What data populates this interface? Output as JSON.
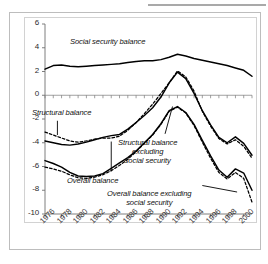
{
  "figure": {
    "background_color": "#ffffff",
    "frame_color": "#bdbdbd"
  },
  "chart_data": {
    "type": "line",
    "title": "",
    "subtitle": "",
    "xlabel": "",
    "ylabel": "",
    "xlim": [
      1976,
      2001
    ],
    "ylim": [
      -10,
      6
    ],
    "yticks": [
      6,
      4,
      2,
      0,
      -2,
      -4,
      -6,
      -8,
      -10
    ],
    "ytick_labels": [
      "6",
      "4",
      "2",
      "0",
      "-2",
      "-4",
      "-6",
      "-8",
      "-10"
    ],
    "xticks": [
      1976,
      1978,
      1980,
      1982,
      1984,
      1986,
      1988,
      1990,
      1992,
      1994,
      1996,
      1998,
      2000
    ],
    "xtick_labels": [
      "1976",
      "1978",
      "1980",
      "1982",
      "1984",
      "1986",
      "1988",
      "1990",
      "1992",
      "1994",
      "1996",
      "1998",
      "2000"
    ],
    "minor_xticks_annual": true,
    "grid": false,
    "zero_line": true,
    "legend": "inline-annotations",
    "x": [
      1976,
      1977,
      1978,
      1979,
      1980,
      1981,
      1982,
      1983,
      1984,
      1985,
      1986,
      1987,
      1988,
      1989,
      1990,
      1991,
      1992,
      1993,
      1994,
      1995,
      1996,
      1997,
      1998,
      1999,
      2000,
      2001
    ],
    "series": [
      {
        "name": "Social security balance",
        "style": "solid",
        "color": "#000000",
        "values": [
          2.2,
          2.5,
          2.55,
          2.45,
          2.4,
          2.45,
          2.5,
          2.55,
          2.6,
          2.65,
          2.75,
          2.85,
          2.9,
          2.9,
          3.0,
          3.2,
          3.45,
          3.3,
          3.1,
          2.95,
          2.8,
          2.65,
          2.5,
          2.3,
          2.1,
          1.6
        ]
      },
      {
        "name": "Structural balance excluding social security",
        "style": "solid",
        "color": "#000000",
        "values": [
          -3.85,
          -4.0,
          -4.15,
          -4.2,
          -4.1,
          -3.95,
          -3.75,
          -3.55,
          -3.4,
          -3.3,
          -2.85,
          -2.3,
          -1.7,
          -1.05,
          -0.15,
          1.05,
          1.95,
          1.4,
          0.15,
          -1.3,
          -2.5,
          -3.55,
          -4.0,
          -3.5,
          -4.05,
          -5.05
        ]
      },
      {
        "name": "Structural balance",
        "style": "solid",
        "color": "#000000",
        "values": [
          -3.85,
          -4.0,
          -4.15,
          -4.2,
          -4.1,
          -3.95,
          -3.75,
          -3.55,
          -3.4,
          -3.3,
          -2.85,
          -2.3,
          -1.7,
          -1.05,
          -0.15,
          1.05,
          1.95,
          1.4,
          0.15,
          -1.3,
          -2.5,
          -3.55,
          -4.0,
          -3.5,
          -4.05,
          -5.05
        ]
      },
      {
        "name": "Structural balance (dashed variant)",
        "style": "dashed",
        "color": "#000000",
        "values": [
          -3.1,
          -3.35,
          -3.6,
          -3.85,
          -3.95,
          -3.85,
          -3.7,
          -3.6,
          -3.6,
          -3.45,
          -2.95,
          -2.3,
          -1.55,
          -0.75,
          0.15,
          1.05,
          2.05,
          1.55,
          0.35,
          -1.35,
          -2.6,
          -3.65,
          -4.1,
          -3.75,
          -4.3,
          -5.3
        ]
      },
      {
        "name": "Overall balance",
        "style": "solid",
        "color": "#000000",
        "values": [
          -5.5,
          -5.75,
          -6.05,
          -6.5,
          -6.8,
          -6.85,
          -6.8,
          -6.6,
          -6.15,
          -5.7,
          -5.25,
          -4.7,
          -4.0,
          -3.3,
          -2.4,
          -1.3,
          -0.95,
          -1.45,
          -2.45,
          -3.8,
          -5.1,
          -6.3,
          -6.9,
          -6.2,
          -6.55,
          -8.0
        ]
      },
      {
        "name": "Overall balance excluding social security",
        "style": "dashed",
        "color": "#000000",
        "values": [
          -6.05,
          -6.2,
          -6.4,
          -6.7,
          -6.95,
          -7.0,
          -6.9,
          -6.7,
          -6.35,
          -5.9,
          -5.4,
          -4.75,
          -4.05,
          -3.35,
          -2.45,
          -1.35,
          -1.0,
          -1.5,
          -2.55,
          -3.95,
          -5.3,
          -6.5,
          -7.05,
          -6.5,
          -7.0,
          -9.0
        ]
      }
    ],
    "annotations": [
      {
        "name": "social-security-balance",
        "text": "Social security balance",
        "lines": [
          "Social security balance"
        ],
        "leader": false
      },
      {
        "name": "structural-balance",
        "text": "Structural balance",
        "lines": [
          "Structural balance"
        ],
        "leader": true
      },
      {
        "name": "overall-balance",
        "text": "Overall balance",
        "lines": [
          "Overall balance"
        ],
        "leader": true
      },
      {
        "name": "structural-balance-excluding-social-security",
        "text": "Structural balance excluding social security",
        "lines": [
          "Structural balance",
          "excluding",
          "social security"
        ],
        "leader": true
      },
      {
        "name": "overall-balance-excluding-social-security",
        "text": "Overall balance excluding social security",
        "lines": [
          "Overall balance excluding",
          "social security"
        ],
        "leader": true
      }
    ]
  }
}
